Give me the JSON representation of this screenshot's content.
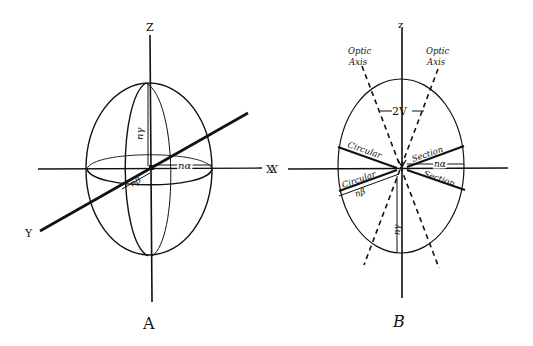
{
  "figure_a": {
    "caption": "A",
    "axes": {
      "z": "Z",
      "x": "X",
      "y": "Y"
    },
    "labels": {
      "n_gamma": "nγ",
      "n_alpha": "nα",
      "n_beta": "nβ"
    }
  },
  "figure_b": {
    "caption": "B",
    "axes": {
      "z": "z",
      "x": "X"
    },
    "optic_axis_left": [
      "Optic",
      "Axis"
    ],
    "optic_axis_right": [
      "Optic",
      "Axis"
    ],
    "angle_label": "2V",
    "circular_section_upper_left": "Circular",
    "circular_section_upper_right": "Section",
    "circular_section_lower_left": "Circular",
    "circular_section_lower_right": "Section",
    "labels": {
      "n_alpha": "nα",
      "n_beta": "nβ",
      "n_gamma": "nγ"
    }
  },
  "colors": {
    "ink": "#111111",
    "background": "#ffffff"
  }
}
